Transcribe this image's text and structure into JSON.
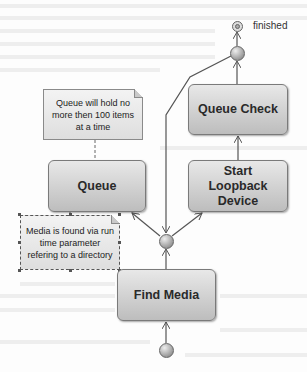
{
  "diagram": {
    "nodes": {
      "find_media": {
        "label": "Find Media"
      },
      "queue": {
        "label": "Queue"
      },
      "start_loopback": {
        "label": "Start Loopback Device"
      },
      "queue_check": {
        "label": "Queue Check"
      }
    },
    "notes": {
      "queue_note": {
        "text": "Queue will hold no more then 100 items at a time"
      },
      "media_note": {
        "text": "Media is found via run time parameter refering to a directory"
      }
    },
    "final_state": {
      "label": "finished"
    }
  },
  "colors": {
    "node_fill_top": "#e8e8e8",
    "node_fill_bottom": "#bdbdbd",
    "line": "#555555"
  }
}
